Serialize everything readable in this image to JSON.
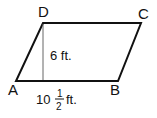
{
  "figure": {
    "shape": "parallelogram",
    "vertices": {
      "A": "A",
      "B": "B",
      "C": "C",
      "D": "D"
    },
    "height_label": "6 ft.",
    "base_label": {
      "whole": "10",
      "numerator": "1",
      "denominator": "2",
      "unit": "ft."
    },
    "colors": {
      "stroke": "#111111",
      "height_line": "#666666"
    }
  }
}
